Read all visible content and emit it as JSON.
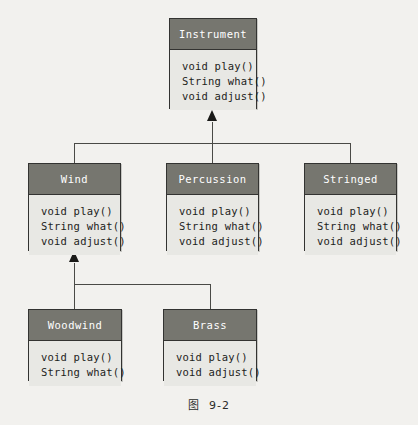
{
  "figure": {
    "caption_label": "图",
    "caption_number": "9-2",
    "colors": {
      "page_background": "#f2f1ee",
      "header_fill": "#76766f",
      "body_fill": "#e8e8e4",
      "border": "#333331",
      "header_text": "#ffffff",
      "body_text": "#1d1d1b",
      "connector": "#4a4a46"
    }
  },
  "classes": {
    "instrument": {
      "name": "Instrument",
      "methods": [
        "void play()",
        "String what()",
        "void adjust()"
      ]
    },
    "wind": {
      "name": "Wind",
      "methods": [
        "void play()",
        "String what()",
        "void adjust()"
      ]
    },
    "percussion": {
      "name": "Percussion",
      "methods": [
        "void play()",
        "String what()",
        "void adjust()"
      ]
    },
    "stringed": {
      "name": "Stringed",
      "methods": [
        "void play()",
        "String what()",
        "void adjust()"
      ]
    },
    "woodwind": {
      "name": "Woodwind",
      "methods": [
        "void play()",
        "String what()"
      ]
    },
    "brass": {
      "name": "Brass",
      "methods": [
        "void play()",
        "void adjust()"
      ]
    }
  }
}
